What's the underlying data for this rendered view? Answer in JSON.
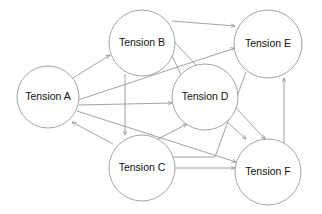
{
  "diagram": {
    "type": "directed-graph",
    "nodes": [
      {
        "id": "A",
        "label": "Tension A",
        "cx": 48,
        "cy": 97,
        "r": 31
      },
      {
        "id": "B",
        "label": "Tension B",
        "cx": 142,
        "cy": 43,
        "r": 33
      },
      {
        "id": "C",
        "label": "Tension C",
        "cx": 142,
        "cy": 168,
        "r": 33
      },
      {
        "id": "D",
        "label": "Tension D",
        "cx": 205,
        "cy": 97,
        "r": 33
      },
      {
        "id": "E",
        "label": "Tension E",
        "cx": 268,
        "cy": 44,
        "r": 34
      },
      {
        "id": "F",
        "label": "Tension F",
        "cx": 268,
        "cy": 172,
        "r": 33
      }
    ],
    "edges": [
      {
        "from": "A",
        "to": "B"
      },
      {
        "from": "A",
        "to": "E"
      },
      {
        "from": "A",
        "to": "D"
      },
      {
        "from": "A",
        "to": "F"
      },
      {
        "from": "C",
        "to": "A"
      },
      {
        "from": "B",
        "to": "C"
      },
      {
        "from": "B",
        "to": "E"
      },
      {
        "from": "B",
        "to": "F"
      },
      {
        "from": "D",
        "to": "B"
      },
      {
        "from": "C",
        "to": "D"
      },
      {
        "from": "D",
        "to": "F"
      },
      {
        "from": "E",
        "to": "C"
      },
      {
        "from": "C",
        "to": "F"
      },
      {
        "from": "F",
        "to": "E"
      }
    ],
    "colors": {
      "stroke": "#9a9a9a",
      "edge": "#8c8c8c",
      "text": "#111111",
      "background": "#ffffff"
    }
  }
}
